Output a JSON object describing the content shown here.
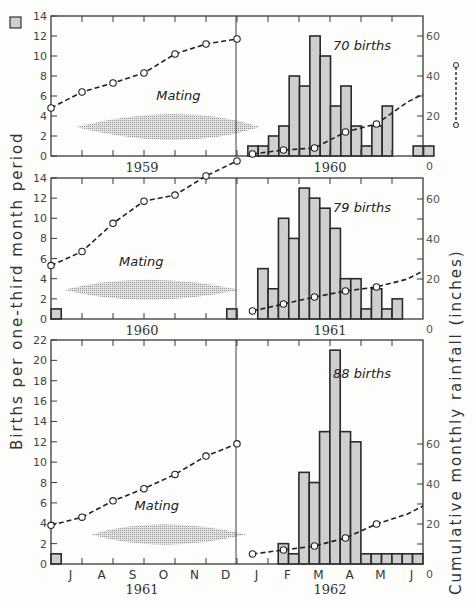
{
  "chart_data": {
    "type": "bar",
    "title": "",
    "ylabel_left": "Births per one-third month period",
    "ylabel_right": "Cumulative monthly rainfall (inches)",
    "legend": [
      {
        "symbol": "shaded-square",
        "label": "Births per one-third month period"
      },
      {
        "symbol": "dashed-line-circles",
        "label": "Cumulative monthly rainfall (inches)"
      }
    ],
    "months_bottom": [
      "J",
      "A",
      "S",
      "O",
      "N",
      "D",
      "J",
      "F",
      "M",
      "A",
      "M",
      "J"
    ],
    "panels": [
      {
        "left_year": "1959",
        "right_year": "1960",
        "ylim_left": [
          0,
          14
        ],
        "yticks_left": [
          0,
          2,
          4,
          6,
          8,
          10,
          12,
          14
        ],
        "ylim_right": [
          0,
          70
        ],
        "yticks_right_labels": [
          0,
          20,
          40,
          60
        ],
        "annotation_births": "70 births",
        "mating_label": "Mating",
        "mating_span": {
          "x_start": 0.8,
          "x_peak": 4.2,
          "x_end": 6.75,
          "half_height": 1.3,
          "center": 2.9
        },
        "births_bins_start": 6.35,
        "births": [
          1,
          1,
          2,
          3,
          8,
          7,
          12,
          10,
          5,
          7,
          3,
          1,
          3,
          5,
          0,
          0,
          1,
          1
        ],
        "rain_x": [
          0,
          1,
          2,
          3,
          4,
          5,
          6
        ],
        "rain_values_left": [
          4.8,
          6.4,
          7.3,
          8.3,
          10.2,
          11.2,
          11.7
        ],
        "rain_x_right": [
          0.5,
          1.5,
          2.5,
          3.5,
          4.5,
          5.5
        ],
        "rain_values_right": [
          1,
          3,
          4,
          12,
          16,
          27
        ]
      },
      {
        "left_year": "1960",
        "right_year": "1961",
        "ylim_left": [
          0,
          14
        ],
        "yticks_left": [
          0,
          2,
          4,
          6,
          8,
          10,
          12,
          14
        ],
        "ylim_right": [
          0,
          70
        ],
        "yticks_right_labels": [
          0,
          20,
          40,
          60
        ],
        "annotation_births": "79 births",
        "mating_label": "Mating",
        "mating_span": {
          "x_start": 0.4,
          "x_peak": 3.0,
          "x_end": 6.1,
          "half_height": 1.0,
          "center": 2.9
        },
        "births_left": [
          {
            "x": 0,
            "w": 0.33,
            "v": 1
          },
          {
            "x": 5.67,
            "w": 0.33,
            "v": 1
          }
        ],
        "births_bins_start": 6.67,
        "births": [
          5,
          3,
          10,
          8,
          13,
          12,
          11,
          9,
          4,
          4,
          1,
          3,
          1,
          2
        ],
        "rain_x": [
          0,
          1,
          2,
          3,
          4,
          5,
          6
        ],
        "rain_values_left": [
          5.3,
          6.7,
          9.5,
          11.7,
          12.3,
          14.2,
          15.7
        ],
        "rain_x_right": [
          0.5,
          1.5,
          2.5,
          3.5,
          4.5,
          5.5
        ],
        "rain_values_right": [
          4,
          7.5,
          11,
          14,
          16,
          20
        ]
      },
      {
        "left_year": "1961",
        "right_year": "1962",
        "ylim_left": [
          0,
          22
        ],
        "yticks_left": [
          0,
          2,
          4,
          6,
          8,
          10,
          12,
          14,
          16,
          18,
          20,
          22
        ],
        "ylim_right": [
          0,
          110
        ],
        "yticks_right_labels": [
          0,
          20,
          40,
          60
        ],
        "annotation_births": "88 births",
        "mating_label": "Mating",
        "mating_span": {
          "x_start": 1.3,
          "x_peak": 3.5,
          "x_end": 6.3,
          "half_height": 1.0,
          "center": 2.9
        },
        "births_left": [
          {
            "x": 0,
            "w": 0.33,
            "v": 1
          }
        ],
        "births_bins_start": 7.33,
        "births": [
          2,
          1,
          9,
          8,
          13,
          21,
          13,
          12,
          1,
          1,
          1,
          1,
          1,
          1
        ],
        "rain_x": [
          0,
          1,
          2,
          3,
          4,
          5,
          6
        ],
        "rain_values_left": [
          3.8,
          4.6,
          6.2,
          7.4,
          8.8,
          10.6,
          11.8
        ],
        "rain_x_right": [
          0.5,
          1.5,
          2.5,
          3.5,
          4.5,
          5.5
        ],
        "rain_values_right": [
          5,
          7,
          9,
          13,
          20,
          25
        ]
      }
    ]
  },
  "labels": {
    "left_axis_title": "Births per one-third month period",
    "right_axis_title": "Cumulative monthly rainfall (inches)"
  }
}
